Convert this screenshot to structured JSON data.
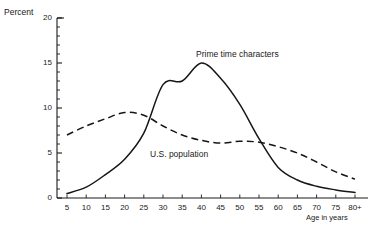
{
  "chart_data": {
    "type": "line",
    "title": "",
    "xlabel": "Age in years",
    "ylabel": "Percent",
    "xlim": [
      0,
      85
    ],
    "ylim": [
      0,
      20
    ],
    "grid": false,
    "legend_position": "inline-annotations",
    "x_tick_labels": [
      "5",
      "10",
      "15",
      "20",
      "25",
      "30",
      "35",
      "40",
      "45",
      "50",
      "55",
      "60",
      "65",
      "70",
      "75",
      "80+"
    ],
    "x_tick_values": [
      5,
      10,
      15,
      20,
      25,
      30,
      35,
      40,
      45,
      50,
      55,
      60,
      65,
      70,
      75,
      80
    ],
    "y_tick_labels": [
      "0",
      "5",
      "10",
      "15",
      "20"
    ],
    "y_tick_values": [
      0,
      5,
      10,
      15,
      20
    ],
    "y_minor_step": 1,
    "series": [
      {
        "name": "Prime time characters",
        "style": "solid",
        "x": [
          5,
          10,
          15,
          20,
          25,
          30,
          35,
          40,
          45,
          50,
          55,
          60,
          65,
          70,
          75,
          80
        ],
        "values": [
          0.5,
          1.2,
          2.6,
          4.3,
          7.2,
          12.6,
          13.0,
          15.0,
          13.3,
          10.4,
          6.6,
          3.4,
          2.0,
          1.3,
          0.9,
          0.6
        ]
      },
      {
        "name": "U.S. population",
        "style": "dashed",
        "x": [
          5,
          10,
          15,
          20,
          25,
          30,
          35,
          40,
          45,
          50,
          55,
          60,
          65,
          70,
          75,
          80
        ],
        "values": [
          7.0,
          8.0,
          8.8,
          9.5,
          9.2,
          8.0,
          7.0,
          6.4,
          6.1,
          6.3,
          6.2,
          5.7,
          5.0,
          4.0,
          2.9,
          2.1
        ]
      }
    ],
    "annotations": [
      {
        "text": "Prime time characters",
        "series": "Prime time characters"
      },
      {
        "text": "U.S. population",
        "series": "U.S. population"
      }
    ]
  },
  "axes": {
    "y_title": "Percent",
    "x_title": "Age in years"
  },
  "caption": ""
}
